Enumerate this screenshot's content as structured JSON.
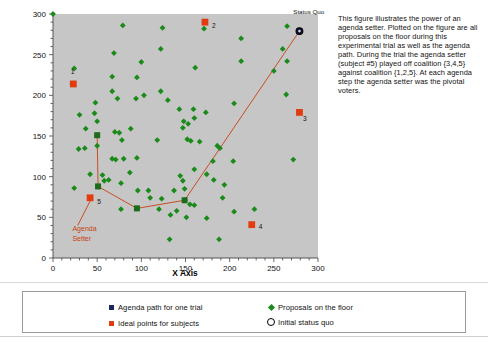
{
  "chart_data": {
    "type": "scatter",
    "title": "",
    "xlabel": "X Axis",
    "ylabel": "",
    "xlim": [
      0,
      300
    ],
    "ylim": [
      0,
      300
    ],
    "xticks": [
      0,
      50,
      100,
      150,
      200,
      250,
      300
    ],
    "yticks": [
      0,
      50,
      100,
      150,
      200,
      250,
      300
    ],
    "minor_tick_step": 10,
    "grid": false,
    "plot_bg_color": "#c6c6c6",
    "legend": {
      "position": "below-plot",
      "entries": [
        {
          "label": "Agenda path for one trial",
          "marker": "square",
          "color": "#1b2a5e"
        },
        {
          "label": "Proposals on the floor",
          "marker": "diamond",
          "color": "#1a8a1a"
        },
        {
          "label": "Ideal points for subjects",
          "marker": "square",
          "color": "#e03c10"
        },
        {
          "label": "Initial status quo",
          "marker": "open-circle",
          "color": "#000000"
        }
      ]
    },
    "annotations": [
      {
        "text": "Status Quo",
        "x": 272,
        "y": 300,
        "color": "#111111"
      },
      {
        "text": "Agenda",
        "x": 22,
        "y": 33,
        "color": "#c8400f"
      },
      {
        "text": "Setter",
        "x": 22,
        "y": 21,
        "color": "#c8400f"
      },
      {
        "text": "1",
        "x": 20,
        "y": 226,
        "color": "#111111"
      },
      {
        "text": "2",
        "x": 180,
        "y": 283,
        "color": "#111111"
      },
      {
        "text": "3",
        "x": 283,
        "y": 168,
        "color": "#111111"
      },
      {
        "text": "4",
        "x": 233,
        "y": 36,
        "color": "#111111"
      },
      {
        "text": "5",
        "x": 50,
        "y": 66,
        "color": "#111111"
      }
    ],
    "series": [
      {
        "name": "Proposals on the floor",
        "marker": "diamond",
        "color": "#1a8a1a",
        "points": [
          [
            0,
            300
          ],
          [
            79,
            286
          ],
          [
            124,
            283
          ],
          [
            171,
            282
          ],
          [
            265,
            285
          ],
          [
            213,
            270
          ],
          [
            69,
            252
          ],
          [
            100,
            241
          ],
          [
            213,
            242
          ],
          [
            265,
            242
          ],
          [
            122,
            257
          ],
          [
            24,
            233
          ],
          [
            95,
            222
          ],
          [
            67,
            223
          ],
          [
            260,
            257
          ],
          [
            161,
            234
          ],
          [
            22,
            214
          ],
          [
            250,
            230
          ],
          [
            67,
            205
          ],
          [
            94,
            196
          ],
          [
            103,
            200
          ],
          [
            122,
            205
          ],
          [
            264,
            201
          ],
          [
            48,
            191
          ],
          [
            73,
            196
          ],
          [
            130,
            194
          ],
          [
            205,
            190
          ],
          [
            30,
            176
          ],
          [
            47,
            178
          ],
          [
            143,
            183
          ],
          [
            159,
            183
          ],
          [
            50,
            168
          ],
          [
            148,
            168
          ],
          [
            153,
            165
          ],
          [
            160,
            172
          ],
          [
            147,
            160
          ],
          [
            37,
            159
          ],
          [
            88,
            159
          ],
          [
            152,
            146
          ],
          [
            118,
            145
          ],
          [
            156,
            144
          ],
          [
            166,
            143
          ],
          [
            78,
            145
          ],
          [
            70,
            155
          ],
          [
            75,
            154
          ],
          [
            50,
            151
          ],
          [
            186,
            138
          ],
          [
            29,
            134
          ],
          [
            36,
            135
          ],
          [
            50,
            138
          ],
          [
            67,
            122
          ],
          [
            71,
            121
          ],
          [
            80,
            122
          ],
          [
            95,
            123
          ],
          [
            181,
            119
          ],
          [
            204,
            119
          ],
          [
            160,
            109
          ],
          [
            42,
            103
          ],
          [
            87,
            105
          ],
          [
            56,
            102
          ],
          [
            174,
            103
          ],
          [
            182,
            96
          ],
          [
            58,
            95
          ],
          [
            63,
            96
          ],
          [
            147,
            95
          ],
          [
            144,
            101
          ],
          [
            77,
            92
          ],
          [
            51,
            88
          ],
          [
            194,
            90
          ],
          [
            96,
            83
          ],
          [
            108,
            83
          ],
          [
            137,
            83
          ],
          [
            149,
            85
          ],
          [
            272,
            121
          ],
          [
            24,
            86
          ],
          [
            42,
            74
          ],
          [
            110,
            74
          ],
          [
            123,
            73
          ],
          [
            149,
            71
          ],
          [
            192,
            74
          ],
          [
            77,
            60
          ],
          [
            95,
            61
          ],
          [
            140,
            58
          ],
          [
            120,
            60
          ],
          [
            155,
            66
          ],
          [
            160,
            65
          ],
          [
            228,
            60
          ],
          [
            133,
            53
          ],
          [
            151,
            50
          ],
          [
            174,
            49
          ],
          [
            205,
            57
          ],
          [
            132,
            23
          ],
          [
            188,
            23
          ],
          [
            173,
            179
          ],
          [
            189,
            135
          ]
        ]
      },
      {
        "name": "Agenda path for one trial",
        "marker": "square",
        "color": "#1d6b1d",
        "points": [
          [
            50,
            151
          ],
          [
            51,
            88
          ],
          [
            95,
            61
          ],
          [
            149,
            71
          ]
        ],
        "path_color": "#c8400f"
      },
      {
        "name": "Ideal points for subjects",
        "marker": "square",
        "color": "#e03c10",
        "points": [
          [
            23,
            214
          ],
          [
            172,
            290
          ],
          [
            279,
            179
          ],
          [
            225,
            41
          ],
          [
            42,
            74
          ]
        ],
        "labels": [
          "1",
          "2",
          "3",
          "4",
          "5"
        ]
      },
      {
        "name": "Initial status quo",
        "marker": "open-circle",
        "color": "#000000",
        "points": [
          [
            279,
            279
          ]
        ]
      }
    ],
    "agenda_path_line": {
      "color": "#c8400f",
      "vertices": [
        [
          50,
          151
        ],
        [
          51,
          88
        ],
        [
          95,
          61
        ],
        [
          149,
          71
        ],
        [
          279,
          279
        ]
      ]
    },
    "agenda_setter_leader": {
      "from": [
        28,
        40
      ],
      "to": [
        42,
        70
      ],
      "color": "#c8400f"
    }
  },
  "description": {
    "paragraph": "This figure illustrates the power of an agenda setter.  Plotted on the figure are all proposals on the floor during this experimental trial as well as the agenda path.  During the trial the agenda setter (subject #5) played off coalition {3,4,5} against coalition {1,2,5}.  At each agenda step the agenda setter was the pivotal voters."
  },
  "legend_panel": {
    "items": [
      {
        "label": "Agenda path for one trial",
        "marker": "navy-square-icon"
      },
      {
        "label": "Proposals on the floor",
        "marker": "green-diamond-icon"
      },
      {
        "label": "Ideal points for subjects",
        "marker": "red-square-icon"
      },
      {
        "label": "Initial status quo",
        "marker": "open-circle-icon"
      }
    ]
  }
}
